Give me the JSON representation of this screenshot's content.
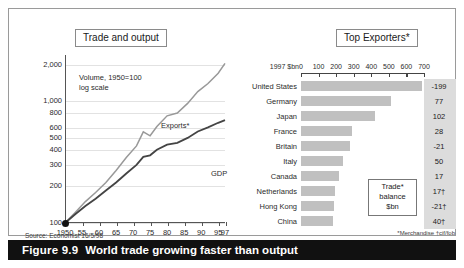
{
  "caption": {
    "number": "Figure 9.9",
    "text": "World trade growing faster than output"
  },
  "left_panel": {
    "title": "Trade and output",
    "note_line1": "Volume, 1950=100",
    "note_line2": "log scale",
    "source": "Source: Economist 16/5/98"
  },
  "right_panel": {
    "title": "Top Exporters*",
    "unit_label": "1997 $bn",
    "callout_line1": "Trade*",
    "callout_line2": "balance",
    "callout_line3": "$bn",
    "footnote": "*Merchandise  †cif/fob"
  },
  "chart_data": [
    {
      "type": "line",
      "title": "Trade and output",
      "subtitle": "Volume, 1950=100, log scale",
      "xlabel": "",
      "ylabel": "Index, 1950=100 (log scale)",
      "grid": true,
      "legend": "inline-labels",
      "yticks": [
        "100",
        "200",
        "300",
        "400",
        "500",
        "600",
        "800",
        "1,000",
        "2,000"
      ],
      "ylim": [
        100,
        2400
      ],
      "xticks": [
        "1950",
        "55",
        "60",
        "65",
        "70",
        "75",
        "80",
        "85",
        "90",
        "95",
        "97"
      ],
      "xlim": [
        1950,
        1997
      ],
      "series": [
        {
          "name": "Exports*",
          "x": [
            1950,
            1953,
            1956,
            1959,
            1962,
            1965,
            1968,
            1971,
            1973,
            1975,
            1977,
            1980,
            1983,
            1986,
            1989,
            1992,
            1995,
            1997
          ],
          "values": [
            100,
            122,
            150,
            178,
            215,
            270,
            345,
            430,
            560,
            520,
            620,
            760,
            800,
            960,
            1200,
            1400,
            1700,
            2050
          ]
        },
        {
          "name": "GDP",
          "x": [
            1950,
            1953,
            1956,
            1959,
            1962,
            1965,
            1968,
            1971,
            1973,
            1975,
            1977,
            1980,
            1983,
            1986,
            1989,
            1992,
            1995,
            1997
          ],
          "values": [
            100,
            118,
            138,
            158,
            185,
            215,
            255,
            300,
            350,
            360,
            400,
            440,
            455,
            500,
            565,
            610,
            665,
            700
          ]
        }
      ]
    },
    {
      "type": "bar",
      "orientation": "horizontal",
      "title": "Top Exporters*",
      "unit": "1997 $bn",
      "xlabel": "1997 $bn",
      "ylabel": "",
      "xlim": [
        0,
        700
      ],
      "xticks": [
        "0",
        "100",
        "200",
        "300",
        "400",
        "500",
        "600",
        "700"
      ],
      "grid": false,
      "categories": [
        "United States",
        "Germany",
        "Japan",
        "France",
        "Britain",
        "Italy",
        "Canada",
        "Netherlands",
        "Hong Kong",
        "China"
      ],
      "values": [
        689,
        512,
        421,
        290,
        281,
        238,
        214,
        193,
        188,
        183
      ],
      "annotation_column_label": "Trade* balance $bn",
      "annotations": [
        "-199",
        "77",
        "102",
        "28",
        "-21",
        "50",
        "17",
        "17†",
        "-21†",
        "40†"
      ]
    }
  ],
  "colors": {
    "bar_fill": "#c0c0c0",
    "balance_column_fill": "#dcdcdc",
    "exports_line": "#999999",
    "gdp_line": "#444444",
    "caption_bg": "#111111",
    "caption_fg": "#ffffff"
  }
}
